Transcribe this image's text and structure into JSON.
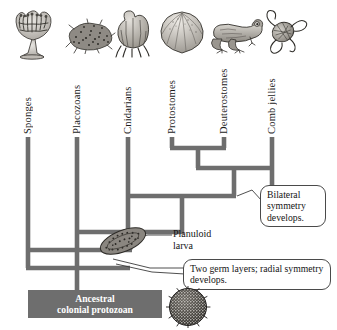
{
  "figure": {
    "type": "phylogenetic-cladogram"
  },
  "taxa": [
    {
      "label": "Sponges",
      "icon": "sponge-illustration",
      "stem_x": 28
    },
    {
      "label": "Placozoans",
      "icon": "placozoan-illustration",
      "stem_x": 77
    },
    {
      "label": "Cnidarians",
      "icon": "cnidarian-illustration",
      "stem_x": 128
    },
    {
      "label": "Protostomes",
      "icon": "clam-illustration",
      "stem_x": 172
    },
    {
      "label": "Deuterostomes",
      "icon": "frog-illustration",
      "stem_x": 224
    },
    {
      "label": "Comb jellies",
      "icon": "comb-jelly-illustration",
      "stem_x": 272
    }
  ],
  "annotations": {
    "bilateral": "Bilateral symmetry develops.",
    "germ_layers": "Two germ layers; radial symmetry develops.",
    "planuloid_line1": "Planuloid",
    "planuloid_line2": "larva"
  },
  "ancestor": {
    "line1": "Ancestral",
    "line2": "colonial protozoan",
    "icon": "colonial-protozoan-sphere"
  },
  "colors": {
    "branch": "#6e6e6e",
    "ancestor_box": "#6e6e6e",
    "ancestor_text": "#ffffff",
    "callout_border": "#4a4a4a",
    "text": "#141414",
    "background": "#ffffff"
  }
}
